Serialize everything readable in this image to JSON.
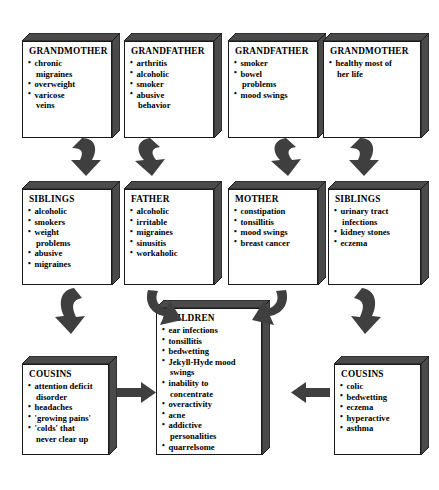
{
  "diagram": {
    "type": "family-health-history-flowchart",
    "shading_color": "#4a4a4a",
    "box_face_color": "#ffffff",
    "outline_color": "#1a1a1a",
    "arrow_color": "#3f3f3f",
    "generations": [
      {
        "generation": "grandparents",
        "boxes": [
          {
            "id": "grandmother-paternal",
            "title": "GRANDMOTHER",
            "items": [
              {
                "text": "chronic",
                "cont": false
              },
              {
                "text": "migraines",
                "cont": true
              },
              {
                "text": "overweight",
                "cont": false
              },
              {
                "text": "varicose",
                "cont": false
              },
              {
                "text": "veins",
                "cont": true
              }
            ]
          },
          {
            "id": "grandfather-paternal",
            "title": "GRANDFATHER",
            "items": [
              {
                "text": "arthritis",
                "cont": false
              },
              {
                "text": "alcoholic",
                "cont": false
              },
              {
                "text": "smoker",
                "cont": false
              },
              {
                "text": "abusive",
                "cont": false
              },
              {
                "text": "behavior",
                "cont": true
              }
            ]
          },
          {
            "id": "grandfather-maternal",
            "title": "GRANDFATHER",
            "items": [
              {
                "text": "smoker",
                "cont": false
              },
              {
                "text": "bowel",
                "cont": false
              },
              {
                "text": "problems",
                "cont": true
              },
              {
                "text": "mood swings",
                "cont": false
              }
            ]
          },
          {
            "id": "grandmother-maternal",
            "title": "GRANDMOTHER",
            "items": [
              {
                "text": "healthy most of",
                "cont": false
              },
              {
                "text": "her life",
                "cont": true
              }
            ]
          }
        ]
      },
      {
        "generation": "parents",
        "boxes": [
          {
            "id": "siblings-paternal",
            "title": "SIBLINGS",
            "items": [
              {
                "text": "alcoholic",
                "cont": false
              },
              {
                "text": "smokers",
                "cont": false
              },
              {
                "text": "weight",
                "cont": false
              },
              {
                "text": "problems",
                "cont": true
              },
              {
                "text": "abusive",
                "cont": false
              },
              {
                "text": "migraines",
                "cont": false
              }
            ]
          },
          {
            "id": "father",
            "title": "FATHER",
            "items": [
              {
                "text": "alcoholic",
                "cont": false
              },
              {
                "text": "irritable",
                "cont": false
              },
              {
                "text": "migraines",
                "cont": false
              },
              {
                "text": "sinusitis",
                "cont": false
              },
              {
                "text": "workaholic",
                "cont": false
              }
            ]
          },
          {
            "id": "mother",
            "title": "MOTHER",
            "items": [
              {
                "text": "constipation",
                "cont": false
              },
              {
                "text": "tonsillitis",
                "cont": false
              },
              {
                "text": "mood swings",
                "cont": false
              },
              {
                "text": "breast cancer",
                "cont": false
              }
            ]
          },
          {
            "id": "siblings-maternal",
            "title": "SIBLINGS",
            "items": [
              {
                "text": "urinary tract",
                "cont": false
              },
              {
                "text": "infections",
                "cont": true
              },
              {
                "text": "kidney stones",
                "cont": false
              },
              {
                "text": "eczema",
                "cont": false
              }
            ]
          }
        ]
      },
      {
        "generation": "children",
        "boxes": [
          {
            "id": "cousins-left",
            "title": "COUSINS",
            "items": [
              {
                "text": "attention deficit",
                "cont": false
              },
              {
                "text": "disorder",
                "cont": true
              },
              {
                "text": "headaches",
                "cont": false
              },
              {
                "text": "'growing pains'",
                "cont": false
              },
              {
                "text": "'colds' that",
                "cont": false
              },
              {
                "text": "never clear up",
                "cont": true
              }
            ]
          },
          {
            "id": "children",
            "title": "CHILDREN",
            "items": [
              {
                "text": "ear infections",
                "cont": false
              },
              {
                "text": "tonsillitis",
                "cont": false
              },
              {
                "text": "bedwetting",
                "cont": false
              },
              {
                "text": "Jekyll-Hyde mood",
                "cont": false
              },
              {
                "text": "swings",
                "cont": true
              },
              {
                "text": "inability to",
                "cont": false
              },
              {
                "text": "concentrate",
                "cont": true
              },
              {
                "text": "overactivity",
                "cont": false
              },
              {
                "text": "acne",
                "cont": false
              },
              {
                "text": "addictive",
                "cont": false
              },
              {
                "text": "personalities",
                "cont": true
              },
              {
                "text": "quarrelsome",
                "cont": false
              }
            ]
          },
          {
            "id": "cousins-right",
            "title": "COUSINS",
            "items": [
              {
                "text": "colic",
                "cont": false
              },
              {
                "text": "bedwetting",
                "cont": false
              },
              {
                "text": "eczema",
                "cont": false
              },
              {
                "text": "hyperactive",
                "cont": false
              },
              {
                "text": "asthma",
                "cont": false
              }
            ]
          }
        ]
      }
    ]
  }
}
